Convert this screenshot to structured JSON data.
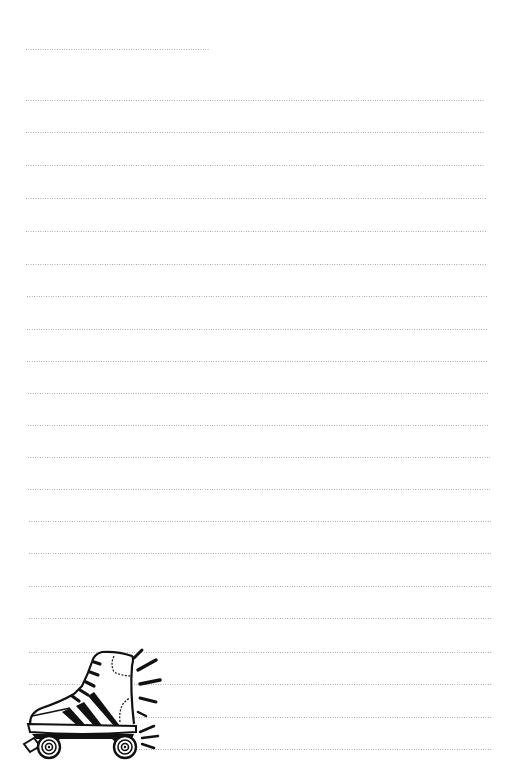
{
  "page": {
    "type": "lined-notebook-page",
    "background_color": "#ffffff",
    "rule_color": "#8a8a8a",
    "rule_style": "dotted"
  },
  "header_rule": {
    "x1": 26,
    "x2": 210,
    "y": 49
  },
  "rules": [
    {
      "y": 100,
      "x1": 26,
      "x2": 485
    },
    {
      "y": 132,
      "x1": 26,
      "x2": 485
    },
    {
      "y": 165,
      "x1": 26,
      "x2": 485
    },
    {
      "y": 198,
      "x1": 26,
      "x2": 486
    },
    {
      "y": 231,
      "x1": 26,
      "x2": 486
    },
    {
      "y": 264,
      "x1": 26,
      "x2": 487
    },
    {
      "y": 296,
      "x1": 27,
      "x2": 487
    },
    {
      "y": 329,
      "x1": 27,
      "x2": 488
    },
    {
      "y": 361,
      "x1": 27,
      "x2": 488
    },
    {
      "y": 393,
      "x1": 28,
      "x2": 489
    },
    {
      "y": 425,
      "x1": 28,
      "x2": 489
    },
    {
      "y": 457,
      "x1": 28,
      "x2": 490
    },
    {
      "y": 489,
      "x1": 28,
      "x2": 490
    },
    {
      "y": 521,
      "x1": 29,
      "x2": 491
    },
    {
      "y": 553,
      "x1": 29,
      "x2": 491
    },
    {
      "y": 586,
      "x1": 29,
      "x2": 491
    },
    {
      "y": 618,
      "x1": 29,
      "x2": 492
    },
    {
      "y": 652,
      "x1": 29,
      "x2": 492
    },
    {
      "y": 684,
      "x1": 29,
      "x2": 492
    },
    {
      "y": 717,
      "x1": 29,
      "x2": 492
    },
    {
      "y": 749,
      "x1": 29,
      "x2": 492
    }
  ],
  "illustration": {
    "icon": "roller-skate-icon",
    "position": "bottom-left",
    "style": "black line art"
  }
}
